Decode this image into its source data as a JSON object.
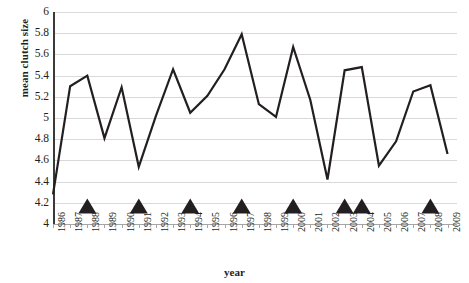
{
  "chart_data": {
    "type": "line",
    "title": "",
    "xlabel": "year",
    "ylabel": "mean clutch size",
    "categories": [
      "1986",
      "1987",
      "1988",
      "1989",
      "1990",
      "1991",
      "1992",
      "1993",
      "1994",
      "1995",
      "1996",
      "1997",
      "1998",
      "1999",
      "2000",
      "2001",
      "2002",
      "2003",
      "2004",
      "2005",
      "2006",
      "2007",
      "2008",
      "2009"
    ],
    "values": [
      4.28,
      5.3,
      5.4,
      4.81,
      5.29,
      4.54,
      5.02,
      5.46,
      5.05,
      5.21,
      5.46,
      5.79,
      5.13,
      5.01,
      5.67,
      5.17,
      4.42,
      5.45,
      5.48,
      4.55,
      4.78,
      5.25,
      5.31,
      4.66
    ],
    "ylim": [
      4,
      6
    ],
    "yticks": [
      "4",
      "4.2",
      "4.4",
      "4.6",
      "4.8",
      "5",
      "5.2",
      "5.4",
      "5.6",
      "5.8",
      "6"
    ],
    "ytick_values": [
      4,
      4.2,
      4.4,
      4.6,
      4.8,
      5,
      5.2,
      5.4,
      5.6,
      5.8,
      6
    ],
    "grid": true,
    "legend": "none",
    "series_color": "#231f20",
    "grid_color": "#d9d9d9",
    "marker_symbol": "triangle-up",
    "marker_color": "#231f20",
    "marker_baseline_value": 4.1,
    "marker_years": [
      "1988",
      "1991",
      "1994",
      "1997",
      "2000",
      "2003",
      "2004",
      "2008"
    ],
    "annotation_note": "filled triangles mark years below the plotted series"
  }
}
